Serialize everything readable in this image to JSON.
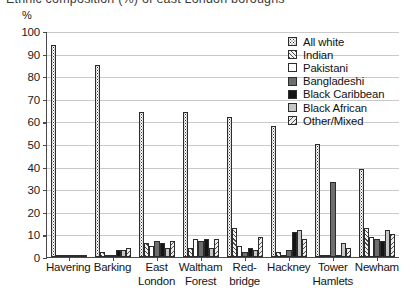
{
  "title": "Ethnic composition (%) of east London boroughs",
  "axis": {
    "y_unit": "%",
    "y_ticks": [
      "100",
      "90",
      "80",
      "70",
      "60",
      "50",
      "40",
      "30",
      "20",
      "10",
      "0"
    ],
    "y_min": 0,
    "y_max": 100
  },
  "legend": [
    {
      "label": "All white",
      "pattern": "p-allwhite",
      "icon": "checker-swatch-icon"
    },
    {
      "label": "Indian",
      "pattern": "p-indian",
      "icon": "diagonal-hatch-swatch-icon"
    },
    {
      "label": "Pakistani",
      "pattern": "p-pakistani",
      "icon": "white-swatch-icon"
    },
    {
      "label": "Bangladeshi",
      "pattern": "p-bangladeshi",
      "icon": "dark-grey-swatch-icon"
    },
    {
      "label": "Black Caribbean",
      "pattern": "p-blackcarib",
      "icon": "black-swatch-icon"
    },
    {
      "label": "Black African",
      "pattern": "p-blackafr",
      "icon": "light-grey-swatch-icon"
    },
    {
      "label": "Other/Mixed",
      "pattern": "p-othermixed",
      "icon": "reverse-hatch-swatch-icon"
    }
  ],
  "chart_data": {
    "type": "bar",
    "title": "Ethnic composition (%) of east London boroughs",
    "xlabel": "",
    "ylabel": "%",
    "ylim": [
      0,
      100
    ],
    "grid": true,
    "legend_position": "top-right",
    "categories": [
      "Havering",
      "Barking",
      "East London",
      "Waltham Forest",
      "Red-bridge",
      "Hackney",
      "Tower Hamlets",
      "Newham"
    ],
    "category_lines": [
      [
        "Havering"
      ],
      [
        "Barking"
      ],
      [
        "East",
        "London"
      ],
      [
        "Waltham",
        "Forest"
      ],
      [
        "Red-",
        "bridge"
      ],
      [
        "Hackney"
      ],
      [
        "Tower",
        "Hamlets"
      ],
      [
        "Newham"
      ]
    ],
    "series": [
      {
        "name": "All white",
        "values": [
          94,
          85,
          64,
          64,
          62,
          58,
          50,
          39
        ]
      },
      {
        "name": "Indian",
        "values": [
          1,
          2,
          6,
          4,
          13,
          2,
          1,
          13
        ]
      },
      {
        "name": "Pakistani",
        "values": [
          0.5,
          1,
          5,
          8,
          5,
          1,
          1,
          9
        ]
      },
      {
        "name": "Bangladeshi",
        "values": [
          0.3,
          1,
          7,
          7,
          2,
          3,
          33,
          8
        ]
      },
      {
        "name": "Black Caribbean",
        "values": [
          1,
          3,
          6,
          8,
          4,
          11,
          1,
          7
        ]
      },
      {
        "name": "Black African",
        "values": [
          0.5,
          3,
          4,
          4,
          3,
          12,
          6,
          12
        ]
      },
      {
        "name": "Other/Mixed",
        "values": [
          1,
          4,
          7,
          8,
          9,
          8,
          4,
          10
        ]
      }
    ]
  }
}
